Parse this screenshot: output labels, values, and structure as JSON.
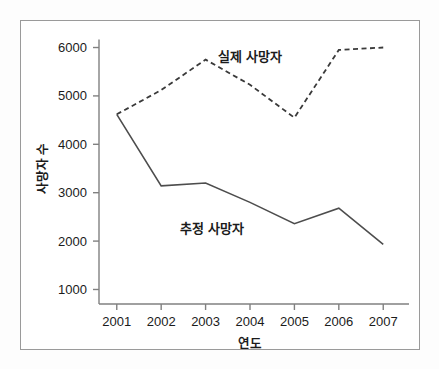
{
  "chart_data": {
    "type": "line",
    "title": "",
    "xlabel": "연도",
    "ylabel": "사망자 수",
    "categories": [
      "2001",
      "2002",
      "2003",
      "2004",
      "2005",
      "2006",
      "2007"
    ],
    "x": [
      2001,
      2002,
      2003,
      2004,
      2005,
      2006,
      2007
    ],
    "xlim": [
      2000.6,
      2007.4
    ],
    "ylim": [
      700,
      6300
    ],
    "grid": false,
    "legend_position": "inline-annotation",
    "yticks": [
      1000,
      2000,
      3000,
      4000,
      5000,
      6000
    ],
    "ytick_labels": [
      "1000",
      "2000",
      "3000",
      "4000",
      "5000",
      "6000"
    ],
    "xticks": [
      2001,
      2002,
      2003,
      2004,
      2005,
      2006,
      2007
    ],
    "xtick_labels": [
      "2001",
      "2002",
      "2003",
      "2004",
      "2005",
      "2006",
      "2007"
    ],
    "series": [
      {
        "name": "실제 사망자",
        "style": "dashed",
        "color": "#3a3a3a",
        "values": [
          4620,
          5120,
          5750,
          5230,
          4550,
          5950,
          6000
        ],
        "annotation": {
          "text": "실제 사망자",
          "x": 2004.0,
          "y": 5720
        }
      },
      {
        "name": "추정 사망자",
        "style": "solid",
        "color": "#4d4d4d",
        "values": [
          4620,
          3140,
          3200,
          2800,
          2360,
          2680,
          1930
        ],
        "annotation": {
          "text": "추정 사망자",
          "x": 2003.15,
          "y": 2170
        }
      }
    ]
  },
  "figure": {
    "background_color": "#fdfdfd",
    "plot_background_color": "#ffffff",
    "frame_color": "#9a9a9a",
    "axis_color": "#808080",
    "text_color": "#1b1b1b"
  }
}
